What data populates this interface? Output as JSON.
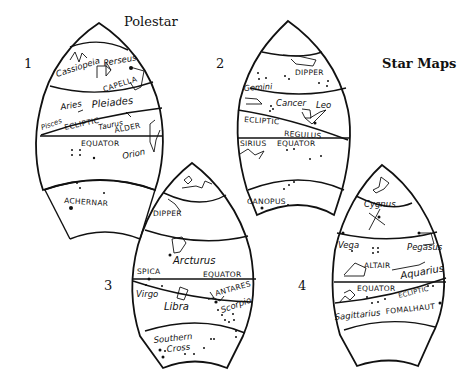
{
  "title": "Star Maps",
  "polestar_label": "Polestar",
  "maps": [
    {
      "number": "1",
      "labels": {
        "cassiopeia": "Cassiopeia",
        "perseus": "Perseus",
        "capella": "CAPELLA",
        "aries": "Aries",
        "pleiades": "Pleiades",
        "pisces": "Pisces",
        "ecliptic": "ECLIPTIC",
        "taurus": "Taurus",
        "alder": "ALDER",
        "equator": "EQUATOR",
        "orion": "Orion",
        "achernar": "ACHERNAR"
      }
    },
    {
      "number": "2",
      "labels": {
        "dipper": "DIPPER",
        "gemini": "Gemini",
        "cancer": "Cancer",
        "leo": "Leo",
        "ecliptic": "ECLIPTIC",
        "regulus": "REGULUS",
        "sirius": "SIRIUS",
        "equator": "EQUATOR",
        "canopus": "CANOPUS"
      }
    },
    {
      "number": "3",
      "labels": {
        "dipper": "DIPPER",
        "arcturus": "Arcturus",
        "spica": "SPICA",
        "equator": "EQUATOR",
        "virgo": "Virgo",
        "libra": "Libra",
        "antares": "ANTARES",
        "scorpio": "Scorpio",
        "southern": "Southern",
        "cross": "Cross"
      }
    },
    {
      "number": "4",
      "labels": {
        "cygnus": "Cygnus",
        "vega": "Vega",
        "pegasus": "Pegasus",
        "altair": "ALTAIR",
        "aquarius": "Aquarius",
        "equator": "EQUATOR",
        "ecliptic": "ECLIPTIC",
        "sagittarius": "Sagittarius",
        "fomalhaut": "FOMALHAUT"
      }
    }
  ]
}
